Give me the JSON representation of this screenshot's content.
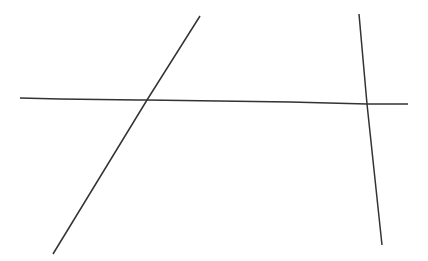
{
  "figure": {
    "width": 428,
    "height": 261,
    "background": "#ffffff",
    "stroke": "#333333",
    "stroke_width": 1.5,
    "lines": [
      {
        "id": "transversal-line",
        "description": "horizontal transversal",
        "points": [
          [
            20,
            98
          ],
          [
            60,
            99
          ],
          [
            138,
            100
          ],
          [
            147,
            100
          ],
          [
            290,
            102
          ],
          [
            367,
            104
          ],
          [
            408,
            104
          ]
        ]
      },
      {
        "id": "left-oblique-line",
        "description": "slanted line rising to the right",
        "points": [
          [
            200,
            16
          ],
          [
            147,
            100
          ],
          [
            53,
            254
          ]
        ]
      },
      {
        "id": "right-near-vertical-line",
        "description": "nearly vertical line slanting slightly right going down",
        "points": [
          [
            359,
            14
          ],
          [
            367,
            104
          ],
          [
            382,
            245
          ]
        ]
      }
    ],
    "intersections": [
      {
        "id": "left-intersection",
        "point": [
          147,
          100
        ]
      },
      {
        "id": "right-intersection",
        "point": [
          367,
          104
        ]
      }
    ]
  }
}
